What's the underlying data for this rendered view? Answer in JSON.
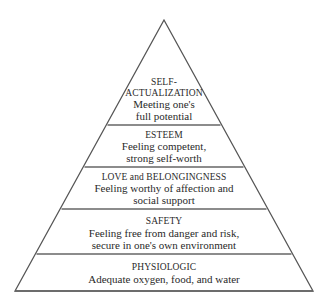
{
  "diagram": {
    "type": "pyramid",
    "colors": {
      "stroke": "#555555",
      "text": "#2a2a2a",
      "background": "#ffffff"
    },
    "levels": [
      {
        "title_lines": [
          "SELF-",
          "ACTUALIZATION"
        ],
        "desc_lines": [
          "Meeting one's",
          "full potential"
        ]
      },
      {
        "title_lines": [
          "ESTEEM"
        ],
        "desc_lines": [
          "Feeling competent,",
          "strong self-worth"
        ]
      },
      {
        "title_lines": [
          "LOVE and BELONGINGNESS"
        ],
        "desc_lines": [
          "Feeling worthy of affection and",
          "social support"
        ]
      },
      {
        "title_lines": [
          "SAFETY"
        ],
        "desc_lines": [
          "Feeling free from danger and risk,",
          "secure in one's own environment"
        ]
      },
      {
        "title_lines": [
          "PHYSIOLOGIC"
        ],
        "desc_lines": [
          "Adequate oxygen, food, and water"
        ]
      }
    ]
  }
}
